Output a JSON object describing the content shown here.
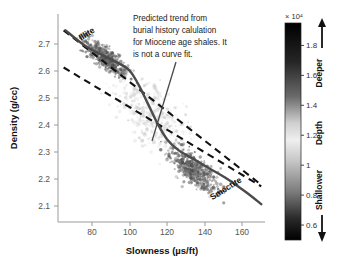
{
  "chart_data": {
    "type": "scatter",
    "title": "",
    "xlabel": "Slowness (µs/ft)",
    "ylabel": "Density (g/cc)",
    "xlim": [
      62,
      172
    ],
    "ylim": [
      2.04,
      2.74
    ],
    "xticks": [
      80,
      100,
      120,
      140,
      160
    ],
    "yticks": [
      2.1,
      2.2,
      2.3,
      2.4,
      2.5,
      2.6,
      2.7
    ],
    "grid": false,
    "legend_position": "none",
    "annotations": [
      {
        "name": "predicted-trend-note",
        "lines": [
          "Predicted trend from",
          "burial history calulation",
          "for Miocene age shales. It",
          "is not a curve fit."
        ],
        "leader_from": [
          176,
          62
        ],
        "leader_to": [
          152,
          141
        ]
      }
    ],
    "series": [
      {
        "name": "Illite",
        "type": "label",
        "label": "Illite",
        "at": [
          78,
          2.665
        ],
        "rotation": -32
      },
      {
        "name": "Smectite",
        "type": "label",
        "label": "Smectite",
        "at": [
          152,
          2.145
        ],
        "rotation": -32
      },
      {
        "name": "Predicted trend (burial history)",
        "type": "line",
        "style": "solid",
        "color": "#4a4a4a",
        "points": [
          [
            66,
            2.685
          ],
          [
            76,
            2.635
          ],
          [
            86,
            2.6
          ],
          [
            94,
            2.575
          ],
          [
            100,
            2.55
          ],
          [
            105,
            2.5
          ],
          [
            110,
            2.435
          ],
          [
            115,
            2.37
          ],
          [
            120,
            2.318
          ],
          [
            126,
            2.282
          ],
          [
            134,
            2.252
          ],
          [
            142,
            2.222
          ],
          [
            152,
            2.185
          ],
          [
            162,
            2.14
          ],
          [
            170,
            2.1
          ]
        ]
      },
      {
        "name": "Illite bound (upper dashed)",
        "type": "line",
        "style": "dashed",
        "color": "#111111",
        "points": [
          [
            65,
            2.685
          ],
          [
            170,
            2.165
          ]
        ]
      },
      {
        "name": "Smectite bound (lower dashed)",
        "type": "line",
        "style": "dashed",
        "color": "#111111",
        "points": [
          [
            65,
            2.56
          ],
          [
            170,
            2.16
          ]
        ]
      },
      {
        "name": "Shallow cluster (smectite-rich, dark)",
        "type": "scatter-cluster",
        "center": [
          134,
          2.215
        ],
        "spread": [
          11,
          0.042
        ],
        "count": 520,
        "shade": "dark"
      },
      {
        "name": "Deep cluster (illite-rich, dark)",
        "type": "scatter-cluster",
        "center": [
          88,
          2.588
        ],
        "spread": [
          10,
          0.03
        ],
        "count": 520,
        "shade": "dark"
      },
      {
        "name": "Transition cloud (mid-depth, light)",
        "type": "scatter-cluster",
        "center": [
          112,
          2.4
        ],
        "spread": [
          16,
          0.085
        ],
        "count": 430,
        "shade": "light"
      }
    ]
  },
  "colorbar": {
    "name": "depth-colorbar",
    "title": "Depth",
    "exponent_label": "× 10⁴",
    "ticks": [
      "1.8",
      "1.6",
      "1.4",
      "1.2",
      "1",
      "0.8",
      "0.6"
    ],
    "tick_values": [
      1.8,
      1.6,
      1.4,
      1.2,
      1.0,
      0.8,
      0.6
    ],
    "range": [
      0.5,
      1.95
    ],
    "top_label": "Deeper",
    "bottom_label": "Shallower",
    "top_arrow": "arrow-up",
    "bottom_arrow": "arrow-down",
    "gradient_stops": [
      {
        "pos": 0,
        "color": "#000000"
      },
      {
        "pos": 18,
        "color": "#262626"
      },
      {
        "pos": 34,
        "color": "#6b6b6b"
      },
      {
        "pos": 46,
        "color": "#cfcfcf"
      },
      {
        "pos": 54,
        "color": "#efefef"
      },
      {
        "pos": 64,
        "color": "#c4c4c4"
      },
      {
        "pos": 78,
        "color": "#7a7a7a"
      },
      {
        "pos": 90,
        "color": "#2a2a2a"
      },
      {
        "pos": 100,
        "color": "#000000"
      }
    ]
  },
  "colors": {
    "axis": "#9a9a9a",
    "trend_line": "#4a4a4a",
    "bound_line": "#111111",
    "point_dark": "#5a5a5a",
    "point_light": "#c8c8c8",
    "background": "#ffffff"
  }
}
